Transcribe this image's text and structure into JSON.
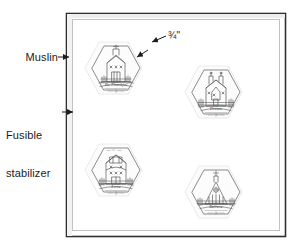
{
  "diagram": {
    "panel": {
      "name": "fabric panel",
      "muslin_color": "#ffffff",
      "border_color": "#3a3a3a",
      "inner_border_color": "#b9b9b9"
    },
    "annotations": {
      "muslin_label": "Muslin",
      "stabilizer_label_line1": "Fusible",
      "stabilizer_label_line2": "stabilizer",
      "spacing_label": "¾\"",
      "spacing_value": "3/4",
      "spacing_unit": "inch"
    },
    "blocks": [
      {
        "id": "block-be-thankful",
        "motif": "church-with-steeple",
        "caption": "Be Thankful",
        "position": "top-left"
      },
      {
        "id": "block-dream",
        "motif": "house-with-two-chimneys",
        "caption": "Dream",
        "position": "top-right"
      },
      {
        "id": "block-love",
        "motif": "barn-house",
        "caption": "Love",
        "position": "bottom-left"
      },
      {
        "id": "block-believe",
        "motif": "church-with-tall-steeple",
        "caption": "Believe",
        "position": "bottom-right"
      }
    ],
    "colors": {
      "patch_fill": "#fbfbfb",
      "patch_stroke": "#e3e3e3",
      "design_stroke": "#555555",
      "ink": "#1b1b1b"
    }
  }
}
